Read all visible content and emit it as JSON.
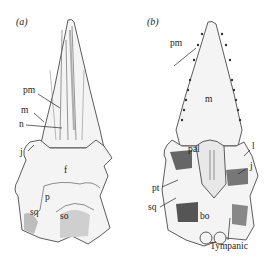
{
  "figure": {
    "panels": [
      {
        "id": "a",
        "label": "(a)",
        "labels": {
          "pm": "pm",
          "m": "m",
          "n": "n",
          "j": "j",
          "f": "f",
          "p": "p",
          "sq": "sq",
          "so": "so"
        }
      },
      {
        "id": "b",
        "label": "(b)",
        "labels": {
          "pm": "pm",
          "m": "m",
          "pal": "pal",
          "l": "l",
          "j": "j",
          "pt": "pt",
          "sq": "sq",
          "bo": "bo",
          "tympanic": "Tympanic"
        }
      }
    ]
  },
  "colors": {
    "ink": "#222222",
    "shade": "#8a8a8a",
    "light": "#d9d9d9",
    "background": "#ffffff"
  }
}
